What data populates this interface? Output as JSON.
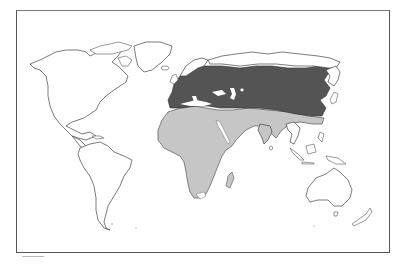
{
  "map": {
    "type": "species distribution range map",
    "projection": "world, equirectangular-like, Atlantic-centered",
    "title": "",
    "colors": {
      "background": "#ffffff",
      "frame": "#555555",
      "coastline": "#444444",
      "primary_range": "#545454",
      "secondary_range": "#c6c6c6"
    },
    "regions": [
      {
        "id": "primary-range",
        "label": "Europe and northern/central Asia (dark)",
        "shade": "dark"
      },
      {
        "id": "secondary-range",
        "label": "Africa, Middle East and South Asia (light)",
        "shade": "light"
      }
    ]
  }
}
